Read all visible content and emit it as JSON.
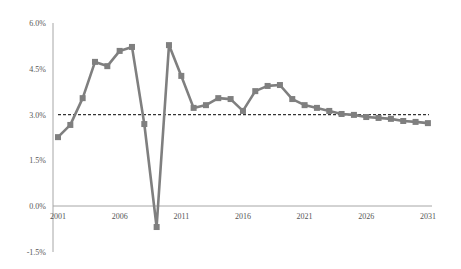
{
  "chart_data": {
    "type": "line",
    "title": "",
    "xlabel": "",
    "ylabel": "",
    "ylim": [
      -1.5,
      6.0
    ],
    "xlim": [
      2001,
      2031
    ],
    "grid": false,
    "legend": null,
    "y_ticks": [
      "6.0%",
      "4.5%",
      "3.0%",
      "1.5%",
      "0.0%",
      "-1.5%"
    ],
    "y_tick_values": [
      6.0,
      4.5,
      3.0,
      1.5,
      0.0,
      -1.5
    ],
    "x_ticks": [
      "2001",
      "2006",
      "2011",
      "2016",
      "2021",
      "2026",
      "2031"
    ],
    "x": [
      2001,
      2002,
      2003,
      2004,
      2005,
      2006,
      2007,
      2008,
      2009,
      2010,
      2011,
      2012,
      2013,
      2014,
      2015,
      2016,
      2017,
      2018,
      2019,
      2020,
      2021,
      2022,
      2023,
      2024,
      2025,
      2026,
      2027,
      2028,
      2029,
      2030,
      2031
    ],
    "series": [
      {
        "name": "Growth rate",
        "color": "#7f7f7f",
        "marker": "square",
        "values": [
          2.26,
          2.66,
          3.54,
          4.73,
          4.59,
          5.09,
          5.22,
          2.69,
          -0.69,
          5.28,
          4.27,
          3.22,
          3.31,
          3.54,
          3.51,
          3.12,
          3.77,
          3.94,
          3.97,
          3.51,
          3.31,
          3.22,
          3.12,
          3.02,
          2.99,
          2.92,
          2.89,
          2.86,
          2.79,
          2.76,
          2.72
        ]
      }
    ],
    "reference_lines": [
      {
        "name": "Average",
        "value": 3.0,
        "style": "dashed",
        "color": "#333333"
      }
    ]
  }
}
